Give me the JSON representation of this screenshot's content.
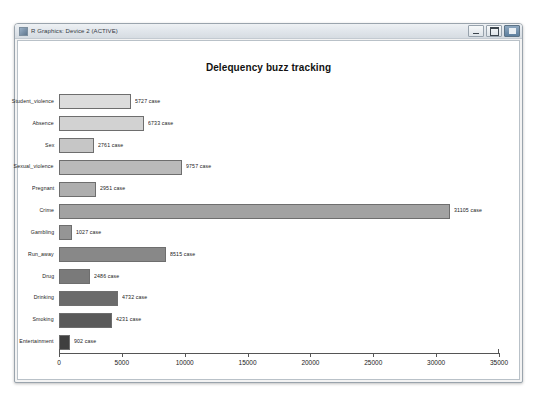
{
  "window": {
    "title": "R Graphics: Device 2 (ACTIVE)",
    "icon": "r-graphics-icon",
    "controls": {
      "minimize": "Minimize",
      "maximize": "Maximize",
      "close": "Close"
    }
  },
  "chart_data": {
    "type": "bar",
    "orientation": "horizontal",
    "title": "Delequency buzz tracking",
    "xlabel": "",
    "ylabel": "",
    "xlim": [
      0,
      35000
    ],
    "xticks": [
      0,
      5000,
      10000,
      15000,
      20000,
      25000,
      30000,
      35000
    ],
    "xticklabels": [
      "0",
      "5000",
      "10000",
      "15000",
      "20000",
      "25000",
      "30000",
      "35000"
    ],
    "grid": false,
    "legend": null,
    "label_suffix": " case",
    "categories": [
      "Student_violence",
      "Absence",
      "Sex",
      "Sexual_violence",
      "Pregnant",
      "Crime",
      "Gambling",
      "Run_away",
      "Drug",
      "Drinking",
      "Smoking",
      "Entertainment"
    ],
    "values": [
      5727,
      6733,
      2761,
      9757,
      2951,
      31105,
      1027,
      8515,
      2486,
      4732,
      4231,
      902
    ],
    "bar_labels": [
      "5727 case",
      "6733 case",
      "2761 case",
      "9757 case",
      "2951 case",
      "31105 case",
      "1027 case",
      "8515 case",
      "2486 case",
      "4732 case",
      "4231 case",
      "902 case"
    ],
    "bar_colors": [
      "#dcdcdc",
      "#d2d2d2",
      "#c6c6c6",
      "#bababa",
      "#aeaeae",
      "#a2a2a2",
      "#959595",
      "#888888",
      "#7a7a7a",
      "#6b6b6b",
      "#5a5a5a",
      "#3f3f3f"
    ]
  }
}
